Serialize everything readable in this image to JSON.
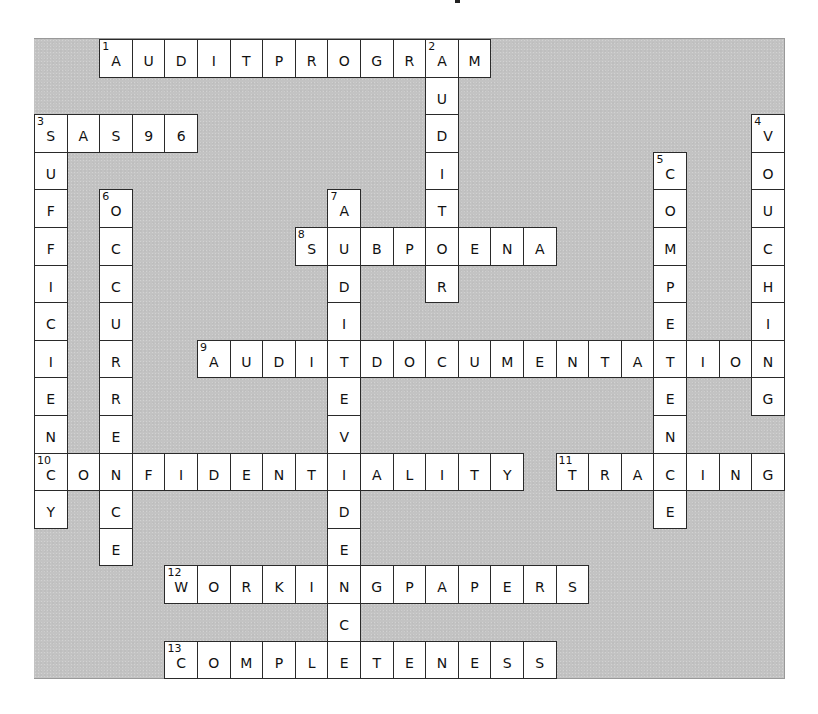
{
  "grid": {
    "cols": 23,
    "rows": 17,
    "origin": {
      "x": 34,
      "y": 38
    },
    "cell_size": {
      "w": 32.6,
      "h": 37.6
    },
    "panel_color": "#c3c3c3",
    "cell_color": "#ffffff",
    "border_color": "#2a2a2a"
  },
  "across": [
    {
      "number": 1,
      "answer": "AUDITPROGRAM",
      "row": 0,
      "col": 2
    },
    {
      "number": 3,
      "answer": "SAS96",
      "row": 2,
      "col": 0
    },
    {
      "number": 8,
      "answer": "SUBPOENA",
      "row": 5,
      "col": 8
    },
    {
      "number": 9,
      "answer": "AUDITDOCUMENTATION",
      "row": 8,
      "col": 5
    },
    {
      "number": 10,
      "answer": "CONFIDENTIALITY",
      "row": 11,
      "col": 0
    },
    {
      "number": 11,
      "answer": "TRACING",
      "row": 11,
      "col": 16
    },
    {
      "number": 12,
      "answer": "WORKINGPAPERS",
      "row": 14,
      "col": 4
    },
    {
      "number": 13,
      "answer": "COMPLETENESS",
      "row": 16,
      "col": 4
    }
  ],
  "down": [
    {
      "number": 2,
      "answer": "AUDITOR",
      "row": 0,
      "col": 12
    },
    {
      "number": 3,
      "answer": "SUFFICIENCY",
      "row": 2,
      "col": 0
    },
    {
      "number": 4,
      "answer": "VOUCHING",
      "row": 2,
      "col": 22
    },
    {
      "number": 5,
      "answer": "COMPETENCE",
      "row": 3,
      "col": 19
    },
    {
      "number": 6,
      "answer": "OCCURRENCE",
      "row": 4,
      "col": 2
    },
    {
      "number": 7,
      "answer": "AUDITEVIDENCE",
      "row": 4,
      "col": 9
    }
  ]
}
